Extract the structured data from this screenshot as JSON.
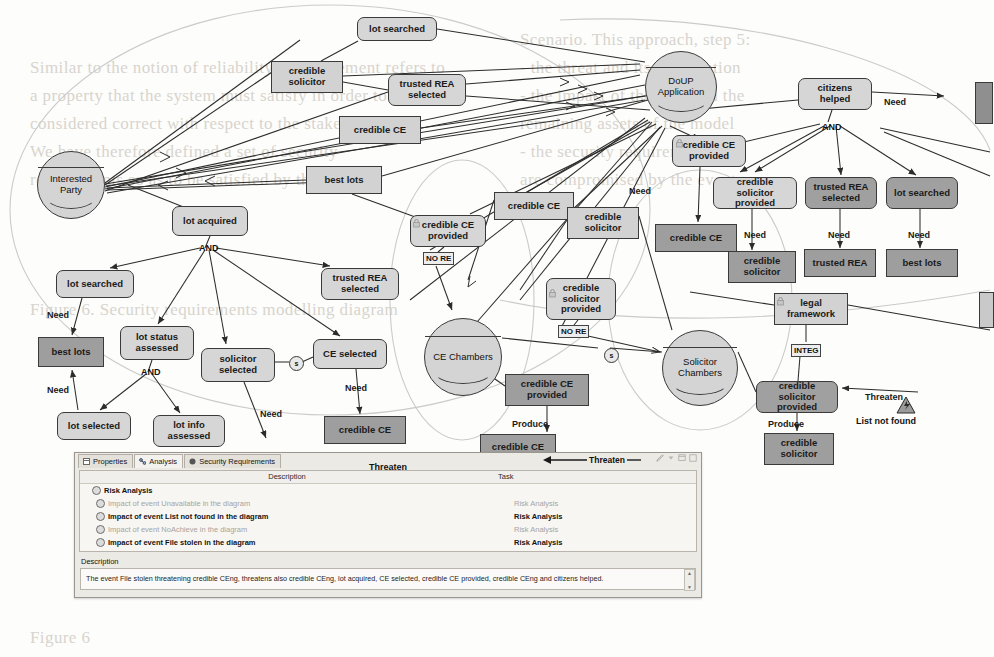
{
  "background_text": [
    {
      "x": 30,
      "y": 58,
      "t": "Similar to the notion of reliability, a requirement refers to"
    },
    {
      "x": 30,
      "y": 86,
      "t": "a property that the system must satisfy in order to be"
    },
    {
      "x": 30,
      "y": 114,
      "t": "considered correct with respect to the stakeholders."
    },
    {
      "x": 30,
      "y": 142,
      "t": "We have therefore defined a set of security"
    },
    {
      "x": 30,
      "y": 170,
      "t": "requirements so as to be satisfied by the asset."
    },
    {
      "x": 30,
      "y": 300,
      "t": "Figure 6. Security requirements modelling diagram"
    },
    {
      "x": 520,
      "y": 30,
      "t": "Scenario. This approach, step 5:"
    },
    {
      "x": 520,
      "y": 58,
      "t": "- the threat and its propagation"
    },
    {
      "x": 520,
      "y": 86,
      "t": "- the impact of the event on the"
    },
    {
      "x": 520,
      "y": 114,
      "t": "remaining assets of the model"
    },
    {
      "x": 520,
      "y": 142,
      "t": "- the security requirements that"
    },
    {
      "x": 520,
      "y": 170,
      "t": "are compromised by the event"
    },
    {
      "x": 30,
      "y": 628,
      "t": "Figure 6"
    }
  ],
  "diagram": {
    "title": "Security Requirements Modelling Diagram",
    "actors": [
      {
        "id": "interested-party",
        "label": "Interested\nParty",
        "x": 37,
        "y": 151,
        "d": 68
      },
      {
        "id": "doup-application",
        "label": "DoUP\nApplication",
        "x": 645,
        "y": 51,
        "d": 72
      },
      {
        "id": "ce-chambers",
        "label": "CE Chambers",
        "x": 424,
        "y": 318,
        "d": 78
      },
      {
        "id": "solicitor-chambers",
        "label": "Solicitor\nChambers",
        "x": 662,
        "y": 330,
        "d": 76
      }
    ],
    "nodes": [
      {
        "id": "lot-searched-top",
        "label": "lot searched",
        "x": 357,
        "y": 17,
        "w": 80,
        "h": 24,
        "style": "goal"
      },
      {
        "id": "credible-solicitor-a",
        "label": "credible\nsolicitor",
        "x": 271,
        "y": 61,
        "w": 72,
        "h": 32,
        "style": "rect-light"
      },
      {
        "id": "trusted-rea-selected-a",
        "label": "trusted REA\nselected",
        "x": 388,
        "y": 74,
        "w": 78,
        "h": 32,
        "style": "goal"
      },
      {
        "id": "credible-ce-a",
        "label": "credible CE",
        "x": 339,
        "y": 116,
        "w": 82,
        "h": 28,
        "style": "rect-light"
      },
      {
        "id": "best-lots-a",
        "label": "best lots",
        "x": 306,
        "y": 166,
        "w": 76,
        "h": 28,
        "style": "rect-light"
      },
      {
        "id": "lot-acquired",
        "label": "lot acquired",
        "x": 172,
        "y": 206,
        "w": 76,
        "h": 30,
        "style": "goal"
      },
      {
        "id": "lot-searched-b",
        "label": "lot searched",
        "x": 56,
        "y": 270,
        "w": 78,
        "h": 28,
        "style": "goal"
      },
      {
        "id": "trusted-rea-selected-b",
        "label": "trusted REA\nselected",
        "x": 321,
        "y": 268,
        "w": 78,
        "h": 32,
        "style": "goal"
      },
      {
        "id": "best-lots-b",
        "label": "best lots",
        "x": 38,
        "y": 337,
        "w": 66,
        "h": 30,
        "style": "rect-dark"
      },
      {
        "id": "lot-status-assessed",
        "label": "lot status\nassessed",
        "x": 120,
        "y": 326,
        "w": 74,
        "h": 34,
        "style": "goal"
      },
      {
        "id": "solicitor-selected",
        "label": "solicitor\nselected",
        "x": 201,
        "y": 348,
        "w": 74,
        "h": 34,
        "style": "goal"
      },
      {
        "id": "ce-selected",
        "label": "CE selected",
        "x": 313,
        "y": 339,
        "w": 74,
        "h": 30,
        "style": "goal"
      },
      {
        "id": "lot-selected",
        "label": "lot selected",
        "x": 57,
        "y": 412,
        "w": 74,
        "h": 28,
        "style": "goal"
      },
      {
        "id": "lot-info-assessed",
        "label": "lot info\nassessed",
        "x": 153,
        "y": 415,
        "w": 72,
        "h": 32,
        "style": "goal"
      },
      {
        "id": "credible-ce-b",
        "label": "credible CE",
        "x": 324,
        "y": 416,
        "w": 82,
        "h": 28,
        "style": "rect-dark"
      },
      {
        "id": "credible-ce-provided-a",
        "label": "credible CE\nprovided",
        "x": 410,
        "y": 215,
        "w": 76,
        "h": 32,
        "style": "goal"
      },
      {
        "id": "credible-ce-c",
        "label": "credible CE",
        "x": 494,
        "y": 192,
        "w": 80,
        "h": 28,
        "style": "rect-light"
      },
      {
        "id": "credible-solicitor-b",
        "label": "credible\nsolicitor",
        "x": 567,
        "y": 207,
        "w": 72,
        "h": 32,
        "style": "rect-light"
      },
      {
        "id": "credible-solicitor-provided-a",
        "label": "credible\nsolicitor\nprovided",
        "x": 546,
        "y": 278,
        "w": 70,
        "h": 42,
        "style": "goal"
      },
      {
        "id": "credible-ce-provided-b",
        "label": "credible CE\nprovided",
        "x": 505,
        "y": 374,
        "w": 84,
        "h": 32,
        "style": "rect-dark"
      },
      {
        "id": "credible-ce-d",
        "label": "credible CE",
        "x": 480,
        "y": 434,
        "w": 76,
        "h": 26,
        "style": "rect-dark"
      },
      {
        "id": "citizens-helped",
        "label": "citizens\nhelped",
        "x": 798,
        "y": 78,
        "w": 74,
        "h": 32,
        "style": "goal"
      },
      {
        "id": "credible-ce-provided-c",
        "label": "credible CE\nprovided",
        "x": 672,
        "y": 135,
        "w": 74,
        "h": 32,
        "style": "goal"
      },
      {
        "id": "credible-solicitor-provided-b",
        "label": "credible solicitor\nprovided",
        "x": 713,
        "y": 177,
        "w": 84,
        "h": 32,
        "style": "goal"
      },
      {
        "id": "trusted-rea-selected-c",
        "label": "trusted REA\nselected",
        "x": 805,
        "y": 177,
        "w": 72,
        "h": 32,
        "style": "goal-dark"
      },
      {
        "id": "lot-searched-c",
        "label": "lot searched",
        "x": 886,
        "y": 177,
        "w": 72,
        "h": 32,
        "style": "goal-dark"
      },
      {
        "id": "credible-ce-e",
        "label": "credible CE",
        "x": 655,
        "y": 224,
        "w": 82,
        "h": 28,
        "style": "rect-dark"
      },
      {
        "id": "credible-solicitor-c",
        "label": "credible\nsolicitor",
        "x": 728,
        "y": 251,
        "w": 68,
        "h": 32,
        "style": "rect-dark"
      },
      {
        "id": "trusted-rea",
        "label": "trusted REA",
        "x": 804,
        "y": 249,
        "w": 72,
        "h": 28,
        "style": "rect-dark"
      },
      {
        "id": "best-lots-c",
        "label": "best lots",
        "x": 886,
        "y": 249,
        "w": 72,
        "h": 28,
        "style": "rect-dark"
      },
      {
        "id": "legal-framework",
        "label": "legal\nframework",
        "x": 774,
        "y": 293,
        "w": 74,
        "h": 32,
        "style": "rect-light"
      },
      {
        "id": "credible-solicitor-provided-c",
        "label": "credible solicitor\nprovided",
        "x": 756,
        "y": 381,
        "w": 82,
        "h": 32,
        "style": "goal-dark"
      },
      {
        "id": "credible-solicitor-d",
        "label": "credible\nsolicitor",
        "x": 764,
        "y": 433,
        "w": 70,
        "h": 32,
        "style": "rect-dark"
      }
    ],
    "edge_labels": [
      {
        "id": "need-1",
        "label": "Need",
        "x": 47,
        "y": 310
      },
      {
        "id": "need-2",
        "label": "Need",
        "x": 47,
        "y": 385
      },
      {
        "id": "need-3",
        "label": "Need",
        "x": 260,
        "y": 409
      },
      {
        "id": "need-4",
        "label": "Need",
        "x": 345,
        "y": 383
      },
      {
        "id": "need-5",
        "label": "Need",
        "x": 629,
        "y": 186
      },
      {
        "id": "need-6",
        "label": "Need",
        "x": 744,
        "y": 230
      },
      {
        "id": "need-7",
        "label": "Need",
        "x": 828,
        "y": 230
      },
      {
        "id": "need-8",
        "label": "Need",
        "x": 908,
        "y": 230
      },
      {
        "id": "need-9",
        "label": "Need",
        "x": 884,
        "y": 97
      },
      {
        "id": "produce-1",
        "label": "Produce",
        "x": 512,
        "y": 419
      },
      {
        "id": "produce-2",
        "label": "Produce",
        "x": 768,
        "y": 419
      },
      {
        "id": "threaten-edge",
        "label": "Threaten",
        "x": 865,
        "y": 392
      }
    ],
    "and_labels": [
      {
        "id": "and-lot-acquired",
        "label": "AND",
        "x": 199,
        "y": 243
      },
      {
        "id": "and-lot-status",
        "label": "AND",
        "x": 141,
        "y": 367
      },
      {
        "id": "and-citizens",
        "label": "AND",
        "x": 822,
        "y": 122
      }
    ],
    "tags": [
      {
        "id": "no-re-1",
        "label": "NO RE",
        "x": 423,
        "y": 252
      },
      {
        "id": "no-re-2",
        "label": "NO RE",
        "x": 558,
        "y": 325
      },
      {
        "id": "integ-1",
        "label": "INTEG",
        "x": 791,
        "y": 344
      }
    ],
    "sec_markers": [
      {
        "id": "sec-marker-1",
        "label": "s",
        "x": 289,
        "y": 356
      },
      {
        "id": "sec-marker-2",
        "label": "s",
        "x": 604,
        "y": 348
      }
    ],
    "threat": {
      "id": "list-not-found",
      "caption": "List not found",
      "x": 896,
      "y": 396
    }
  },
  "panel": {
    "tabs": [
      {
        "id": "tab-properties",
        "label": "Properties",
        "icon": "properties-icon",
        "active": false
      },
      {
        "id": "tab-analysis",
        "label": "Analysis",
        "icon": "analysis-icon",
        "active": true
      },
      {
        "id": "tab-security-requirements",
        "label": "Security Requirements",
        "icon": "security-icon",
        "active": false
      }
    ],
    "title": "Threaten",
    "threaten_marker": "Threaten",
    "columns": {
      "description": "Description",
      "task": "Task"
    },
    "rows": [
      {
        "id": "row-risk-analysis",
        "description": "Risk Analysis",
        "task": "",
        "level": 0,
        "state": "root"
      },
      {
        "id": "row-unavailable",
        "description": "Impact of event Unavailable in the diagram",
        "task": "Risk Analysis",
        "level": 1,
        "state": "dim"
      },
      {
        "id": "row-list-not-found",
        "description": "Impact of event List not found in the diagram",
        "task": "Risk Analysis",
        "level": 1,
        "state": "strong"
      },
      {
        "id": "row-noachieve",
        "description": "Impact of event NoAchieve in the diagram",
        "task": "Risk Analysis",
        "level": 1,
        "state": "dim"
      },
      {
        "id": "row-file-stolen",
        "description": "Impact of event File stolen in the diagram",
        "task": "Risk Analysis",
        "level": 1,
        "state": "strong"
      }
    ],
    "description_label": "Description",
    "description_text": "The event File stolen threatening credible CEng, threatens also credible CEng, lot acquired, CE selected, credible CE provided, credible CEng and citizens helped.",
    "window_tools": [
      "edit-icon",
      "menu-icon",
      "minimize-icon",
      "maximize-icon"
    ]
  },
  "colors": {
    "node_light": "#d2d2d2",
    "node_dark": "#9e9e9e",
    "stroke": "#3a3a3a",
    "panel_bg": "#eceae4",
    "panel_field": "#f7f6f3"
  }
}
